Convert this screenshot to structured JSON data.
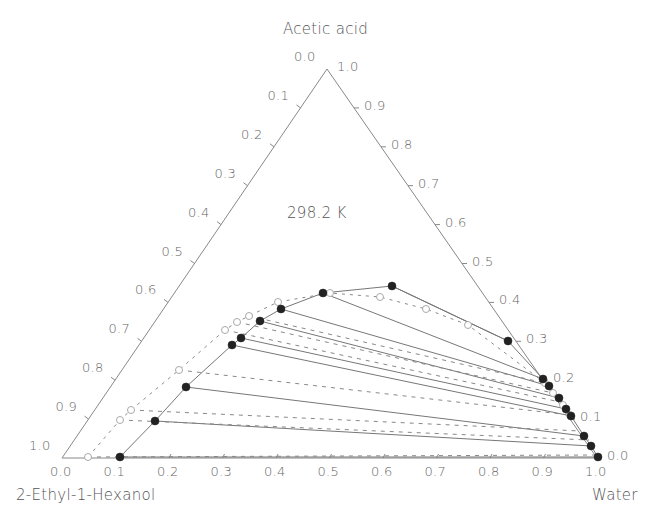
{
  "chart_data": {
    "type": "ternary",
    "title": "",
    "annotation": "298.2 K",
    "components": {
      "top": "Acetic acid",
      "bottom_left": "2-Ethyl-1-Hexanol",
      "bottom_right": "Water"
    },
    "axes": {
      "left_edge_ticks": [
        "0.0",
        "0.1",
        "0.2",
        "0.3",
        "0.4",
        "0.5",
        "0.6",
        "0.7",
        "0.8",
        "0.9",
        "1.0"
      ],
      "right_edge_ticks": [
        "1.0",
        "0.9",
        "0.8",
        "0.7",
        "0.6",
        "0.5",
        "0.4",
        "0.3",
        "0.2",
        "0.1",
        "0.0"
      ],
      "bottom_edge_ticks": [
        "0.0",
        "0.1",
        "0.2",
        "0.3",
        "0.4",
        "0.5",
        "0.6",
        "0.7",
        "0.8",
        "0.9",
        "1.0"
      ]
    },
    "grid": false,
    "legend": null,
    "series": [
      {
        "name": "Experimental binodal (filled circles, solid)",
        "marker": "filled-circle",
        "line": "solid",
        "points_px": [
          [
            120,
            457
          ],
          [
            155,
            421
          ],
          [
            186,
            387
          ],
          [
            232,
            345
          ],
          [
            241,
            338
          ],
          [
            260,
            321
          ],
          [
            281,
            309
          ],
          [
            323,
            293
          ],
          [
            392,
            286
          ],
          [
            508,
            341
          ],
          [
            543,
            379
          ],
          [
            549,
            386
          ],
          [
            559,
            398
          ],
          [
            566,
            409
          ],
          [
            571,
            416
          ],
          [
            584,
            436
          ],
          [
            591,
            446
          ],
          [
            598,
            457
          ]
        ]
      },
      {
        "name": "Calculated binodal (open circles, dashed)",
        "marker": "open-circle",
        "line": "dashed",
        "points_px": [
          [
            88,
            457
          ],
          [
            120,
            420
          ],
          [
            131,
            410
          ],
          [
            179,
            370
          ],
          [
            225,
            330
          ],
          [
            237,
            322
          ],
          [
            249,
            316
          ],
          [
            278,
            302
          ],
          [
            330,
            293
          ],
          [
            380,
            297
          ],
          [
            426,
            309
          ],
          [
            468,
            325
          ],
          [
            545,
            383
          ],
          [
            553,
            393
          ],
          [
            563,
            405
          ],
          [
            570,
            415
          ]
        ]
      }
    ],
    "tie_lines_experimental": [
      [
        [
          120,
          457
        ],
        [
          598,
          457
        ]
      ],
      [
        [
          155,
          421
        ],
        [
          591,
          446
        ]
      ],
      [
        [
          186,
          387
        ],
        [
          584,
          436
        ]
      ],
      [
        [
          232,
          345
        ],
        [
          571,
          416
        ]
      ],
      [
        [
          241,
          338
        ],
        [
          566,
          409
        ]
      ],
      [
        [
          260,
          321
        ],
        [
          559,
          398
        ]
      ],
      [
        [
          281,
          309
        ],
        [
          549,
          386
        ]
      ],
      [
        [
          323,
          293
        ],
        [
          543,
          379
        ]
      ],
      [
        [
          392,
          286
        ],
        [
          508,
          341
        ]
      ]
    ],
    "tie_lines_calculated": [
      [
        [
          88,
          457
        ],
        [
          598,
          455
        ]
      ],
      [
        [
          120,
          420
        ],
        [
          589,
          440
        ]
      ],
      [
        [
          131,
          410
        ],
        [
          580,
          431
        ]
      ],
      [
        [
          179,
          370
        ],
        [
          570,
          415
        ]
      ],
      [
        [
          225,
          330
        ],
        [
          560,
          402
        ]
      ],
      [
        [
          237,
          322
        ],
        [
          553,
          393
        ]
      ],
      [
        [
          249,
          316
        ],
        [
          545,
          383
        ]
      ]
    ],
    "geometry_px": {
      "top": [
        327,
        69
      ],
      "left": [
        62,
        458
      ],
      "right": [
        597,
        458
      ]
    }
  }
}
